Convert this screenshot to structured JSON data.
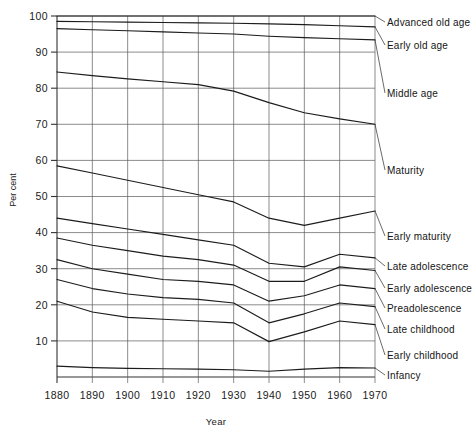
{
  "chart_data": {
    "type": "line",
    "title": "",
    "xlabel": "Year",
    "ylabel": "Per cent",
    "x": [
      1880,
      1890,
      1900,
      1910,
      1920,
      1930,
      1940,
      1950,
      1960,
      1970
    ],
    "xlim": [
      1880,
      1970
    ],
    "ylim": [
      0,
      100
    ],
    "xticks": [
      "1880",
      "1890",
      "1900",
      "1910",
      "1920",
      "1930",
      "1940",
      "1950",
      "1960",
      "1970"
    ],
    "yticks": [
      "100",
      "90",
      "80",
      "70",
      "60",
      "50",
      "40",
      "30",
      "20",
      "10"
    ],
    "grid": true,
    "legend_position": "right-inline-labels",
    "series": [
      {
        "name": "Advanced old age",
        "values": [
          100.0,
          100.0,
          100.0,
          100.0,
          100.0,
          100.0,
          100.0,
          100.0,
          100.0,
          100.0
        ]
      },
      {
        "name": "Early old age",
        "values": [
          98.5,
          98.4,
          98.3,
          98.2,
          98.1,
          98.0,
          97.8,
          97.6,
          97.3,
          97.0
        ]
      },
      {
        "name": "Middle age",
        "values": [
          96.5,
          96.2,
          95.9,
          95.6,
          95.3,
          95.0,
          94.4,
          94.0,
          93.7,
          93.4
        ]
      },
      {
        "name": "Maturity",
        "values": [
          84.5,
          83.5,
          82.6,
          81.8,
          81.0,
          79.2,
          76.0,
          73.2,
          71.5,
          70.0
        ]
      },
      {
        "name": "Early maturity",
        "values": [
          58.5,
          56.5,
          54.5,
          52.5,
          50.5,
          48.5,
          44.0,
          42.0,
          44.0,
          46.0
        ]
      },
      {
        "name": "Late adolescence",
        "values": [
          44.0,
          42.5,
          41.0,
          39.5,
          38.0,
          36.5,
          31.5,
          30.5,
          34.0,
          33.0
        ]
      },
      {
        "name": "Early adolescence",
        "values": [
          38.5,
          36.5,
          35.0,
          33.5,
          32.5,
          31.0,
          26.5,
          26.5,
          30.5,
          29.5
        ]
      },
      {
        "name": "Preadolescence",
        "values": [
          32.5,
          30.0,
          28.5,
          27.0,
          26.5,
          25.5,
          21.0,
          22.5,
          25.5,
          24.5
        ]
      },
      {
        "name": "Late childhood",
        "values": [
          27.0,
          24.5,
          23.0,
          22.0,
          21.5,
          20.5,
          15.0,
          17.5,
          20.5,
          19.5
        ]
      },
      {
        "name": "Early childhood",
        "values": [
          21.0,
          18.0,
          16.5,
          16.0,
          15.5,
          15.0,
          9.8,
          12.5,
          15.5,
          14.5
        ]
      },
      {
        "name": "Infancy",
        "values": [
          3.0,
          2.6,
          2.4,
          2.3,
          2.2,
          2.0,
          1.6,
          2.2,
          2.6,
          2.5
        ]
      }
    ],
    "label_anchors": [
      {
        "name": "Advanced old age",
        "y": 22
      },
      {
        "name": "Early old age",
        "y": 45
      },
      {
        "name": "Middle age",
        "y": 93
      },
      {
        "name": "Maturity",
        "y": 170
      },
      {
        "name": "Early maturity",
        "y": 236
      },
      {
        "name": "Late adolescence",
        "y": 266
      },
      {
        "name": "Early adolescence",
        "y": 288
      },
      {
        "name": "Preadolescence",
        "y": 308
      },
      {
        "name": "Late childhood",
        "y": 329
      },
      {
        "name": "Early childhood",
        "y": 355
      },
      {
        "name": "Infancy",
        "y": 375
      }
    ]
  }
}
